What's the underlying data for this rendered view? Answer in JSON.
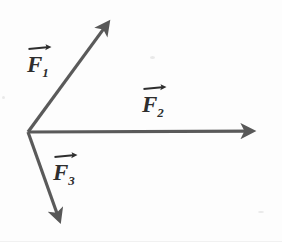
{
  "figure": {
    "width": 282,
    "height": 242,
    "background_color": "#fdfdfd",
    "stroke_color": "#5a5a5a",
    "label_color": "#2e2e2e",
    "stroke_width": 3.2,
    "origin": {
      "x": 28,
      "y": 132
    }
  },
  "chart_data": {
    "type": "scatter",
    "title": "",
    "xlabel": "",
    "ylabel": "",
    "grid": false,
    "legend": "none",
    "origin": {
      "x": 28,
      "y": 132
    },
    "vectors": [
      {
        "name": "F1",
        "label": "F",
        "subscript": "1",
        "tail": {
          "x": 28,
          "y": 132
        },
        "tip": {
          "x": 116,
          "y": 12
        },
        "dx": 88,
        "dy": -120,
        "angle_deg": 53.7,
        "length_px": 148.8,
        "label_position": {
          "x": 27,
          "y": 44
        }
      },
      {
        "name": "F2",
        "label": "F",
        "subscript": "2",
        "tail": {
          "x": 28,
          "y": 132
        },
        "tip": {
          "x": 266,
          "y": 131
        },
        "dx": 238,
        "dy": -1,
        "angle_deg": 0.2,
        "length_px": 238.0,
        "label_position": {
          "x": 142,
          "y": 84
        }
      },
      {
        "name": "F3",
        "label": "F",
        "subscript": "3",
        "tail": {
          "x": 28,
          "y": 132
        },
        "tip": {
          "x": 64,
          "y": 233
        },
        "dx": 36,
        "dy": 101,
        "angle_deg": -70.4,
        "length_px": 107.2,
        "label_position": {
          "x": 53,
          "y": 152
        }
      }
    ]
  },
  "labels": {
    "f1": {
      "base": "F",
      "sub": "1"
    },
    "f2": {
      "base": "F",
      "sub": "2"
    },
    "f3": {
      "base": "F",
      "sub": "3"
    }
  }
}
